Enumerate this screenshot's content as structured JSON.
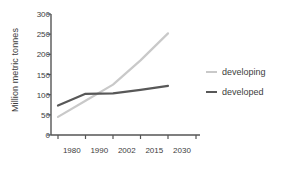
{
  "chart_data": {
    "type": "line",
    "title": "",
    "xlabel": "",
    "ylabel": "Million metric tonnes",
    "categories": [
      "1980",
      "1990",
      "2002",
      "2015",
      "2030"
    ],
    "x_tick_labels": [
      "1980",
      "1990",
      "2002",
      "2015",
      "2030"
    ],
    "y_tick_labels": [
      "0",
      "50",
      "100",
      "150",
      "200",
      "250",
      "300"
    ],
    "y_ticks": [
      0,
      50,
      100,
      150,
      200,
      250,
      300
    ],
    "ylim": [
      0,
      300
    ],
    "grid": false,
    "legend_position": "right",
    "series": [
      {
        "name": "developing",
        "color": "#c9c9c9",
        "values": [
          45,
          85,
          125,
          185,
          252
        ]
      },
      {
        "name": "developed",
        "color": "#585858",
        "values": [
          73,
          102,
          103,
          112,
          122
        ]
      }
    ]
  },
  "axis": {
    "line_color": "#555555"
  }
}
